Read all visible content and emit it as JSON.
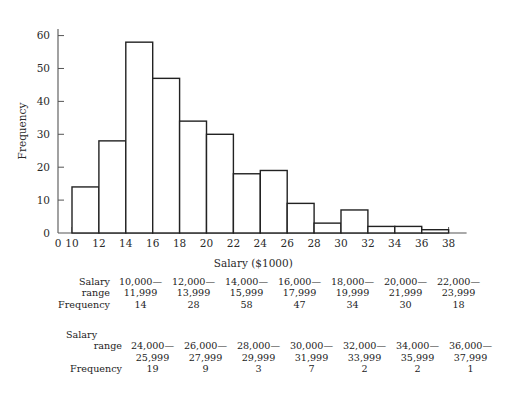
{
  "chart_data": {
    "type": "bar",
    "title": "",
    "xlabel": "Salary ($1000)",
    "ylabel": "Frequency",
    "xlim": [
      10,
      38
    ],
    "ylim": [
      0,
      62
    ],
    "grid": false,
    "legend": "none",
    "bin_width": 2,
    "x_tick_labels": [
      "0",
      "10",
      "12",
      "14",
      "16",
      "18",
      "20",
      "22",
      "24",
      "26",
      "28",
      "30",
      "32",
      "34",
      "36",
      "38"
    ],
    "y_tick_labels": [
      "0",
      "10",
      "20",
      "30",
      "40",
      "50",
      "60"
    ],
    "y_ticks": [
      0,
      10,
      20,
      30,
      40,
      50,
      60
    ],
    "bin_edges": [
      10,
      12,
      14,
      16,
      18,
      20,
      22,
      24,
      26,
      28,
      30,
      32,
      34,
      36,
      38
    ],
    "categories": [
      "10-12",
      "12-14",
      "14-16",
      "16-18",
      "18-20",
      "20-22",
      "22-24",
      "24-26",
      "26-28",
      "28-30",
      "30-32",
      "32-34",
      "34-36",
      "36-38"
    ],
    "values": [
      14,
      28,
      58,
      47,
      34,
      30,
      18,
      19,
      9,
      3,
      7,
      2,
      2,
      1
    ],
    "bar_fill": "#ffffff",
    "bar_stroke": "#222222",
    "axis_color": "#555555"
  },
  "tables": [
    {
      "row_labels": [
        "Salary",
        "range",
        "Frequency"
      ],
      "salary_range_top": [
        "10,000—",
        "12,000—",
        "14,000—",
        "16,000—",
        "18,000—",
        "20,000—",
        "22,000—"
      ],
      "salary_range_bottom": [
        "11,999",
        "13,999",
        "15,999",
        "17,999",
        "19,999",
        "21,999",
        "23,999"
      ],
      "frequency": [
        "14",
        "28",
        "58",
        "47",
        "34",
        "30",
        "18"
      ]
    },
    {
      "row_labels": [
        "Salary",
        "range",
        "Frequency"
      ],
      "salary_range_top": [
        "24,000—",
        "26,000—",
        "28,000—",
        "30,000—",
        "32,000—",
        "34,000—",
        "36,000—"
      ],
      "salary_range_bottom": [
        "25,999",
        "27,999",
        "29,999",
        "31,999",
        "33,999",
        "35,999",
        "37,999"
      ],
      "frequency": [
        "19",
        "9",
        "3",
        "7",
        "2",
        "2",
        "1"
      ]
    }
  ]
}
